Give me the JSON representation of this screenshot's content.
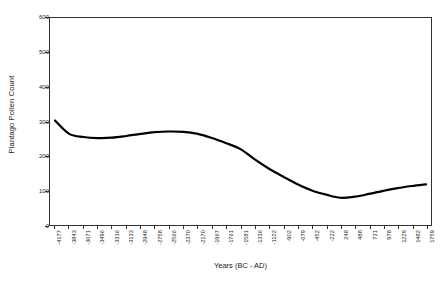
{
  "chart_data": {
    "type": "line",
    "title": "",
    "xlabel": "Years (BC - AD)",
    "ylabel": "Plantago Pollen Count",
    "ylim": [
      0,
      600
    ],
    "yticks": [
      0,
      100,
      200,
      300,
      400,
      500,
      600
    ],
    "ytick_labels": [
      "0",
      "100",
      "200",
      "300",
      "400",
      "500",
      "600"
    ],
    "grid": false,
    "legend": null,
    "frame": true,
    "categories": [
      "-4177",
      "-3843",
      "-3671",
      "-3496",
      "-3316",
      "-3133",
      "-2948",
      "-2758",
      "-2566",
      "-2370",
      "-2170",
      "-1967",
      "-1761",
      "-1581",
      "-1336",
      "-1122",
      "-902",
      "-679",
      "-452",
      "-222",
      "248",
      "488",
      "731",
      "978",
      "1229",
      "1482",
      "1759"
    ],
    "x_values": [
      -4177,
      -3843,
      -3671,
      -3496,
      -3316,
      -3133,
      -2948,
      -2758,
      -2566,
      -2370,
      -2170,
      -1967,
      -1761,
      -1581,
      -1336,
      -1122,
      -902,
      -679,
      -452,
      -222,
      248,
      488,
      731,
      978,
      1229,
      1482,
      1759
    ],
    "values": [
      303,
      264,
      255,
      252,
      253,
      258,
      264,
      269,
      271,
      270,
      264,
      252,
      237,
      220,
      190,
      163,
      140,
      118,
      100,
      88,
      79,
      82,
      90,
      99,
      107,
      113,
      118
    ],
    "series": [
      {
        "name": "Plantago Pollen Count",
        "color": "#000000",
        "line_width": 2.2,
        "values": [
          303,
          264,
          255,
          252,
          253,
          258,
          264,
          269,
          271,
          270,
          264,
          252,
          237,
          220,
          190,
          163,
          140,
          118,
          100,
          88,
          79,
          82,
          90,
          99,
          107,
          113,
          118
        ]
      }
    ],
    "annotations": {
      "start_value": 303,
      "first_minimum": 252,
      "local_maximum": 271,
      "global_minimum": 79,
      "end_value": 118
    }
  },
  "colors": {
    "axis": "#333333",
    "line": "#000000",
    "text": "#1a1a1a",
    "background": "#ffffff"
  }
}
